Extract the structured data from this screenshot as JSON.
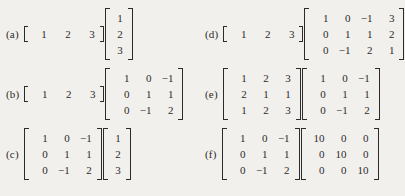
{
  "page": {
    "kind": "math-exercise-list",
    "text_color": "#2b2b2b",
    "background_color": "#f2f0ec"
  },
  "items": [
    {
      "label": "(a)",
      "factors": [
        {
          "name": "row-vector",
          "bracket": "square",
          "inline": true,
          "rows": [
            [
              "1",
              "2",
              "3"
            ]
          ]
        },
        {
          "name": "column-vector",
          "bracket": "square",
          "colvec": true,
          "rows": [
            [
              "1"
            ],
            [
              "2"
            ],
            [
              "3"
            ]
          ]
        }
      ]
    },
    {
      "label": "(b)",
      "factors": [
        {
          "name": "row-vector",
          "bracket": "square",
          "inline": true,
          "rows": [
            [
              "1",
              "2",
              "3"
            ]
          ]
        },
        {
          "name": "matrix-3x3",
          "bracket": "square",
          "rows": [
            [
              "1",
              "0",
              "−1"
            ],
            [
              "0",
              "1",
              "1"
            ],
            [
              "0",
              "−1",
              "2"
            ]
          ]
        }
      ]
    },
    {
      "label": "(c)",
      "factors": [
        {
          "name": "matrix-3x3",
          "bracket": "square",
          "rows": [
            [
              "1",
              "0",
              "−1"
            ],
            [
              "0",
              "1",
              "1"
            ],
            [
              "0",
              "−1",
              "2"
            ]
          ]
        },
        {
          "name": "column-vector",
          "bracket": "square",
          "colvec": true,
          "rows": [
            [
              "1"
            ],
            [
              "2"
            ],
            [
              "3"
            ]
          ]
        }
      ]
    },
    {
      "label": "(d)",
      "factors": [
        {
          "name": "row-vector",
          "bracket": "square",
          "inline": true,
          "rows": [
            [
              "1",
              "2",
              "3"
            ]
          ]
        },
        {
          "name": "matrix-3x4",
          "bracket": "square",
          "rows": [
            [
              "1",
              "0",
              "−1",
              "3"
            ],
            [
              "0",
              "1",
              "1",
              "2"
            ],
            [
              "0",
              "−1",
              "2",
              "1"
            ]
          ]
        }
      ]
    },
    {
      "label": "(e)",
      "factors": [
        {
          "name": "matrix-3x3",
          "bracket": "square",
          "rows": [
            [
              "1",
              "2",
              "3"
            ],
            [
              "2",
              "1",
              "1"
            ],
            [
              "1",
              "2",
              "3"
            ]
          ]
        },
        {
          "name": "matrix-3x3",
          "bracket": "square",
          "rows": [
            [
              "1",
              "0",
              "−1"
            ],
            [
              "0",
              "1",
              "1"
            ],
            [
              "0",
              "−1",
              "2"
            ]
          ]
        }
      ]
    },
    {
      "label": "(f)",
      "factors": [
        {
          "name": "matrix-3x3",
          "bracket": "square",
          "rows": [
            [
              "1",
              "0",
              "−1"
            ],
            [
              "0",
              "1",
              "1"
            ],
            [
              "0",
              "−1",
              "2"
            ]
          ]
        },
        {
          "name": "diagonal-matrix-3x3",
          "bracket": "square",
          "rows": [
            [
              "10",
              "0",
              "0"
            ],
            [
              "0",
              "10",
              "0"
            ],
            [
              "0",
              "0",
              "10"
            ]
          ]
        }
      ]
    }
  ],
  "layout": {
    "positions": [
      {
        "left": 6,
        "top": 8,
        "align": "center"
      },
      {
        "left": 6,
        "top": 68,
        "align": "center"
      },
      {
        "left": 6,
        "top": 128,
        "align": "center"
      },
      {
        "left": 205,
        "top": 8,
        "align": "center"
      },
      {
        "left": 205,
        "top": 68,
        "align": "center"
      },
      {
        "left": 205,
        "top": 128,
        "align": "center"
      }
    ]
  }
}
